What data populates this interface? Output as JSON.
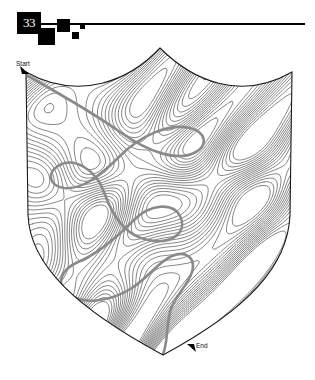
{
  "page": {
    "background_color": "#ffffff",
    "width": 315,
    "height": 380
  },
  "header": {
    "puzzle_number": "33",
    "badge_color": "#000000",
    "badge_text_color": "#ffffff",
    "rule_color": "#000000",
    "decorations": [
      "square-large",
      "square-medium",
      "square-small",
      "square-tiny"
    ]
  },
  "maze": {
    "shape": "shield",
    "outline_color": "#1a1a1a",
    "wall_color": "#555555",
    "solution_color": "#8a8a8a",
    "start_label": "Start",
    "end_label": "End",
    "start_point": [
      26,
      72
    ],
    "end_point": [
      190,
      348
    ],
    "arrow_color": "#000000"
  }
}
